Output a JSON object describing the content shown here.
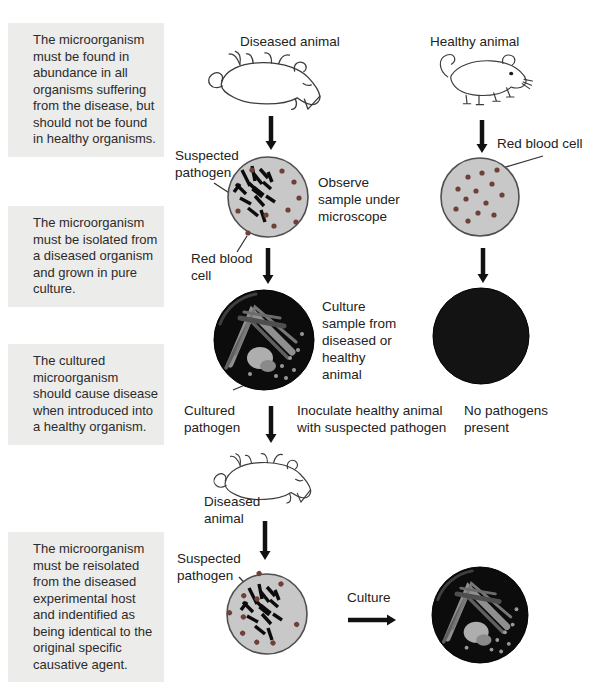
{
  "postulates": [
    "The microorganism must be found in abundance in all organisms suffering from the disease, but should not be found in healthy organisms.",
    "The microorganism must be isolated from a diseased organism and grown in pure culture.",
    "The cultured microorganism should cause disease when introduced into a healthy organism.",
    "The microorganism must be reisolated from the diseased experimental host and indentified as being identical to the original specific causative agent."
  ],
  "labels": {
    "diseased_animal_top": "Diseased animal",
    "healthy_animal": "Healthy animal",
    "suspected_pathogen_top": "Suspected pathogen",
    "observe_sample": "Observe sample under microscope",
    "red_blood_cell_right": "Red blood cell",
    "red_blood_cell_left": "Red blood cell",
    "culture_sample": "Culture sample from diseased or healthy animal",
    "cultured_pathogen": "Cultured pathogen",
    "inoculate": "Inoculate healthy animal with suspected pathogen",
    "no_pathogens": "No pathogens present",
    "diseased_animal_mid": "Diseased animal",
    "suspected_pathogen_bottom": "Suspected pathogen",
    "culture": "Culture"
  },
  "colors": {
    "postulate_bg": "#ececea",
    "text": "#2b2b2b",
    "dish_fill": "#c8c8c8",
    "dish_stroke": "#4f4f4f",
    "red_blood_cell": "#6d4038",
    "pathogen_rod": "#0b0b0b",
    "arrow": "#111111",
    "culture_dish_bg": "#0c0c0c"
  }
}
